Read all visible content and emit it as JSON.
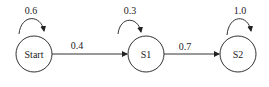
{
  "diagram": {
    "type": "state-transition",
    "nodes": [
      {
        "id": "start",
        "label": "Start",
        "self_loop": "0.6"
      },
      {
        "id": "s1",
        "label": "S1",
        "self_loop": "0.3"
      },
      {
        "id": "s2",
        "label": "S2",
        "self_loop": "1.0"
      }
    ],
    "edges": [
      {
        "from": "start",
        "to": "s1",
        "label": "0.4"
      },
      {
        "from": "s1",
        "to": "s2",
        "label": "0.7"
      }
    ]
  }
}
